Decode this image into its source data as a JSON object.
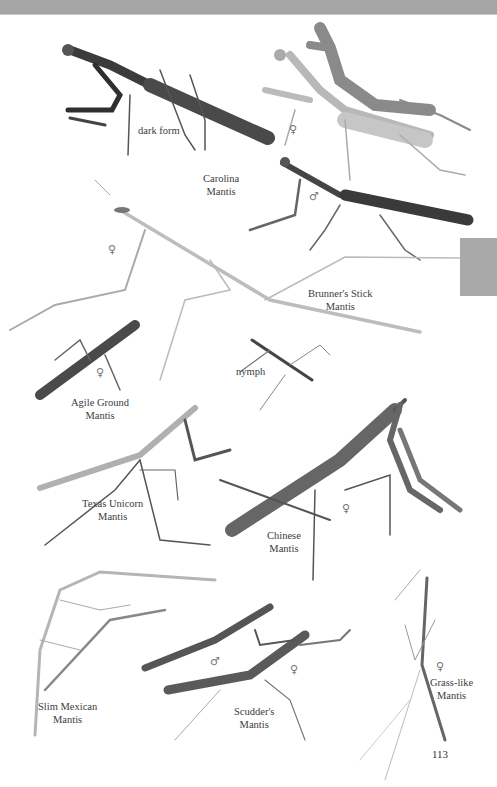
{
  "page": {
    "number": "113",
    "header_bar_color": "#a5a5a5",
    "thumb_tab_color": "#a9a9a9"
  },
  "species": [
    {
      "name_line1": "Carolina",
      "name_line2": "Mantis",
      "variant_label": "dark form",
      "sex_symbols": [
        "♀",
        "♂"
      ]
    },
    {
      "name_line1": "Brunner's Stick",
      "name_line2": "Mantis",
      "sex_symbols": [
        "♀"
      ]
    },
    {
      "name_line1": "Agile Ground",
      "name_line2": "Mantis",
      "sex_symbols": [
        "♀"
      ]
    },
    {
      "name_line1": "nymph",
      "name_line2": ""
    },
    {
      "name_line1": "Texas Unicorn",
      "name_line2": "Mantis"
    },
    {
      "name_line1": "Chinese",
      "name_line2": "Mantis",
      "sex_symbols": [
        "♀"
      ]
    },
    {
      "name_line1": "Slim Mexican",
      "name_line2": "Mantis"
    },
    {
      "name_line1": "Scudder's",
      "name_line2": "Mantis",
      "sex_symbols": [
        "♂",
        "♀"
      ]
    },
    {
      "name_line1": "Grass-like",
      "name_line2": "Mantis",
      "sex_symbols": [
        "♀"
      ]
    }
  ]
}
